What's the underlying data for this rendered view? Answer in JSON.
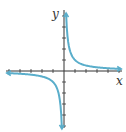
{
  "chart_data": {
    "type": "line",
    "title": "",
    "function": "y = 1/x",
    "xlabel": "x",
    "ylabel": "y",
    "xlim": [
      -5.5,
      5.5
    ],
    "ylim": [
      -5.5,
      5.5
    ],
    "x_ticks": [
      -5,
      -4,
      -3,
      -2,
      -1,
      1,
      2,
      3,
      4,
      5
    ],
    "y_ticks": [
      -5,
      -4,
      -3,
      -2,
      -1,
      1,
      2,
      3,
      4,
      5
    ],
    "grid": false,
    "series": [
      {
        "name": "branch-positive",
        "x": [
          0.18,
          0.25,
          0.5,
          1,
          2,
          3,
          4,
          5.5
        ],
        "y": [
          5.5,
          4,
          2,
          1,
          0.5,
          0.333,
          0.25,
          0.18
        ]
      },
      {
        "name": "branch-negative",
        "x": [
          -5.5,
          -4,
          -3,
          -2,
          -1,
          -0.5,
          -0.25,
          -0.18
        ],
        "y": [
          -0.18,
          -0.25,
          -0.333,
          -0.5,
          -1,
          -2,
          -4,
          -5.5
        ]
      }
    ],
    "colors": {
      "curve": "#5aaecb",
      "axis": "#333333"
    }
  },
  "labels": {
    "x": "x",
    "y": "y"
  }
}
